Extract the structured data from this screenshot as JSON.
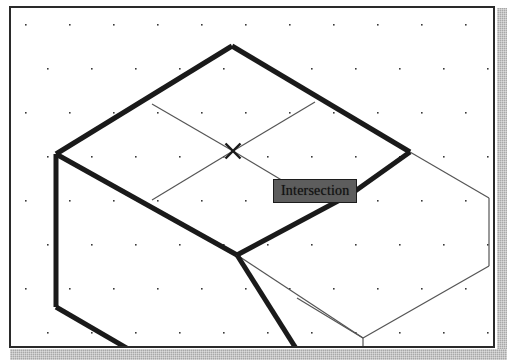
{
  "window": {
    "kind": "cad-viewport",
    "border_color": "#2a2a2a",
    "background_color": "#ffffff",
    "shadow_color": "#a8a8a8"
  },
  "viewport": {
    "name": "3d-model-viewport",
    "grid": {
      "visible": true,
      "dot_color": "#3a3a3a",
      "spacing_x": 44,
      "spacing_y": 44,
      "stagger_x": 22,
      "dot_size": 1.6,
      "origin_x": 14,
      "origin_y": 16
    },
    "geometry": {
      "heavy_line_color": "#1a1a1a",
      "heavy_line_width": 5,
      "light_line_color": "#555555",
      "light_line_width": 1.2,
      "heavy_edges": [
        [
          [
            221,
            38
          ],
          [
            45,
            146
          ]
        ],
        [
          [
            221,
            38
          ],
          [
            399,
            144
          ]
        ],
        [
          [
            45,
            146
          ],
          [
            45,
            299
          ]
        ],
        [
          [
            45,
            146
          ],
          [
            226,
            247
          ]
        ],
        [
          [
            399,
            144
          ],
          [
            340,
            186
          ]
        ],
        [
          [
            340,
            186
          ],
          [
            226,
            247
          ]
        ],
        [
          [
            45,
            299
          ],
          [
            119,
            342
          ]
        ],
        [
          [
            226,
            247
          ],
          [
            286,
            342
          ]
        ]
      ],
      "light_edges": [
        [
          [
            141,
            96
          ],
          [
            222,
            143
          ]
        ],
        [
          [
            222,
            143
          ],
          [
            304,
            94
          ]
        ],
        [
          [
            222,
            143
          ],
          [
            141,
            192
          ]
        ],
        [
          [
            222,
            143
          ],
          [
            304,
            192
          ]
        ],
        [
          [
            399,
            144
          ],
          [
            478,
            190
          ]
        ],
        [
          [
            478,
            190
          ],
          [
            478,
            258
          ]
        ],
        [
          [
            478,
            258
          ],
          [
            352,
            330
          ]
        ],
        [
          [
            352,
            330
          ],
          [
            352,
            342
          ]
        ],
        [
          [
            352,
            330
          ],
          [
            286,
            290
          ]
        ],
        [
          [
            226,
            247
          ],
          [
            352,
            330
          ]
        ]
      ]
    },
    "snap_marker": {
      "name": "intersection-snap-marker",
      "shape": "x-cross",
      "x": 222,
      "y": 143,
      "size": 15,
      "color": "#1a1a1a",
      "line_width": 2.4
    }
  },
  "tooltip": {
    "label": "Intersection",
    "background_color": "#5d5d5d",
    "border_color": "#1c1c1c",
    "text_color": "#111111"
  }
}
